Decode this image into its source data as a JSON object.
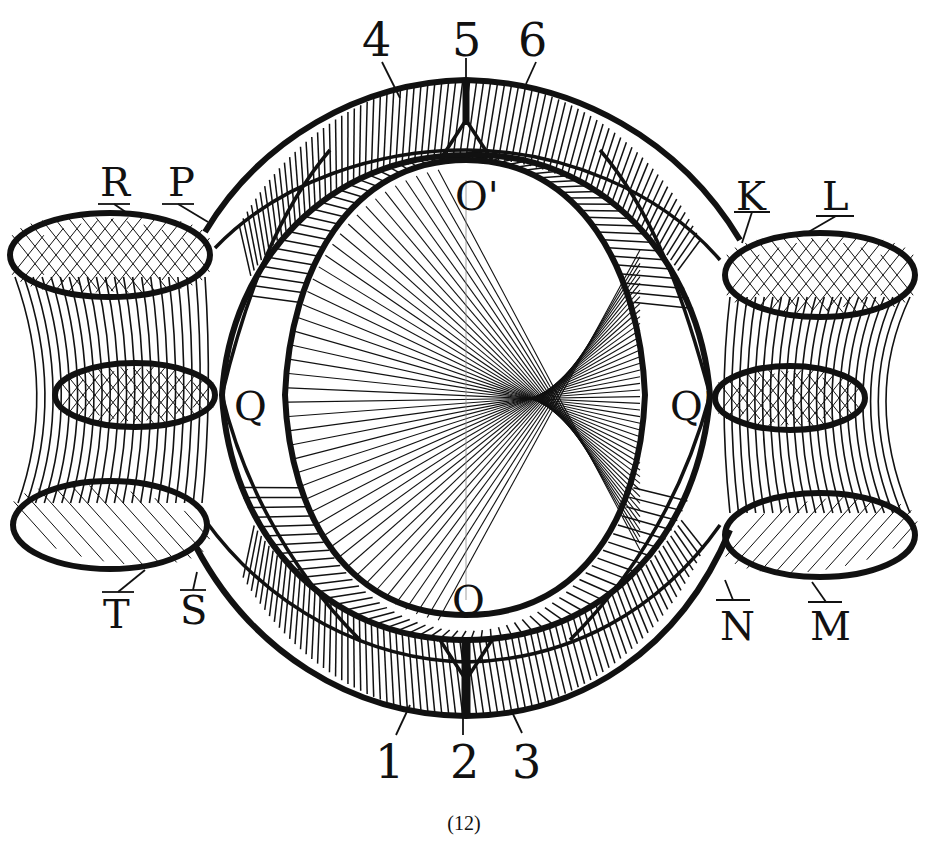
{
  "figure": {
    "caption": "(12)",
    "colors": {
      "ink": "#111111",
      "paper": "#ffffff"
    },
    "labels": {
      "top": [
        {
          "id": "4",
          "text": "4"
        },
        {
          "id": "5",
          "text": "5"
        },
        {
          "id": "6",
          "text": "6"
        }
      ],
      "bottom": [
        {
          "id": "1",
          "text": "1"
        },
        {
          "id": "2",
          "text": "2"
        },
        {
          "id": "3",
          "text": "3"
        }
      ],
      "left": [
        {
          "id": "R",
          "text": "R"
        },
        {
          "id": "P",
          "text": "P"
        },
        {
          "id": "T",
          "text": "T"
        },
        {
          "id": "S",
          "text": "S"
        },
        {
          "id": "Q",
          "text": "Q"
        }
      ],
      "right": [
        {
          "id": "K",
          "text": "K"
        },
        {
          "id": "L",
          "text": "L"
        },
        {
          "id": "N",
          "text": "N"
        },
        {
          "id": "M",
          "text": "M"
        },
        {
          "id": "Q_prime",
          "text": "Q'"
        }
      ],
      "center": [
        {
          "id": "O_prime",
          "text": "O'"
        },
        {
          "id": "O",
          "text": "O"
        }
      ]
    }
  }
}
